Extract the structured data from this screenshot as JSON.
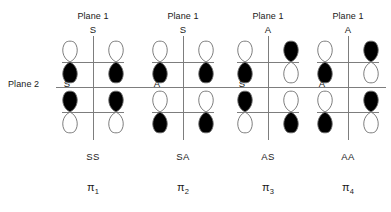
{
  "figure": {
    "title_left_label": "Plane 2",
    "plane1_label": "Plane 1",
    "mirror_planes": [
      "Plane 1",
      "Plane 2"
    ],
    "symmetry_key": {
      "S": "symmetric",
      "A": "antisymmetric"
    }
  },
  "chart_data": {
    "type": "diagram",
    "title": "",
    "xlabel": "",
    "ylabel": "",
    "columns": [
      {
        "mo_label": "π1",
        "mo_sub": "1",
        "plane1_header": "Plane 1",
        "plane1_symmetry": "S",
        "plane2_symmetry": "S",
        "combined_symmetry": "SS",
        "top_row": [
          {
            "upper_lobe": "white",
            "lower_lobe": "black"
          },
          {
            "upper_lobe": "white",
            "lower_lobe": "black"
          }
        ],
        "bottom_row": [
          {
            "upper_lobe": "black",
            "lower_lobe": "white"
          },
          {
            "upper_lobe": "black",
            "lower_lobe": "white"
          }
        ]
      },
      {
        "mo_label": "π2",
        "mo_sub": "2",
        "plane1_header": "Plane 1",
        "plane1_symmetry": "S",
        "plane2_symmetry": "A",
        "combined_symmetry": "SA",
        "top_row": [
          {
            "upper_lobe": "white",
            "lower_lobe": "black"
          },
          {
            "upper_lobe": "white",
            "lower_lobe": "black"
          }
        ],
        "bottom_row": [
          {
            "upper_lobe": "white",
            "lower_lobe": "black"
          },
          {
            "upper_lobe": "white",
            "lower_lobe": "black"
          }
        ]
      },
      {
        "mo_label": "π3",
        "mo_sub": "3",
        "plane1_header": "Plane 1",
        "plane1_symmetry": "A",
        "plane2_symmetry": "S",
        "combined_symmetry": "AS",
        "top_row": [
          {
            "upper_lobe": "white",
            "lower_lobe": "black"
          },
          {
            "upper_lobe": "black",
            "lower_lobe": "white"
          }
        ],
        "bottom_row": [
          {
            "upper_lobe": "black",
            "lower_lobe": "white"
          },
          {
            "upper_lobe": "white",
            "lower_lobe": "black"
          }
        ]
      },
      {
        "mo_label": "π4",
        "mo_sub": "4",
        "plane1_header": "Plane 1",
        "plane1_symmetry": "A",
        "plane2_symmetry": "A",
        "combined_symmetry": "AA",
        "top_row": [
          {
            "upper_lobe": "white",
            "lower_lobe": "black"
          },
          {
            "upper_lobe": "black",
            "lower_lobe": "white"
          }
        ],
        "bottom_row": [
          {
            "upper_lobe": "white",
            "lower_lobe": "black"
          },
          {
            "upper_lobe": "black",
            "lower_lobe": "white"
          }
        ]
      }
    ],
    "colors": {
      "lobe_filled": "#000000",
      "lobe_empty": "#ffffff",
      "lobe_stroke": "#6e6e6e",
      "rule": "#7d7d7d",
      "text": "#1a1a1a",
      "background": "#ffffff"
    }
  }
}
